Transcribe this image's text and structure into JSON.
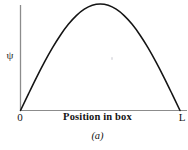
{
  "figure": {
    "caption": "(a)",
    "background_color": "#ffffff",
    "curve_color": "#141414",
    "axis_color": "#8c8c8c"
  },
  "axes": {
    "y_label": "ψ",
    "y_label_name": "psi-symbol",
    "x_title": "Position in box",
    "x_tick_left": "0",
    "x_tick_right": "L"
  },
  "chart_data": {
    "type": "line",
    "title": "",
    "subtitle": "",
    "xlabel": "Position in box",
    "ylabel": "ψ",
    "annotations": [
      "(a)"
    ],
    "legend": [],
    "legend_position": "none",
    "grid": false,
    "xlim": [
      0,
      1
    ],
    "ylim": [
      0,
      1
    ],
    "xtick_labels": [
      "0",
      "L"
    ],
    "xtick_values": [
      0,
      1
    ],
    "ytick_labels": [],
    "ytick_values": [],
    "series": [
      {
        "name": "ψ (n=1)",
        "color": "#141414",
        "x": [
          0.0,
          0.05,
          0.1,
          0.15,
          0.2,
          0.25,
          0.3,
          0.35,
          0.4,
          0.45,
          0.5,
          0.55,
          0.6,
          0.65,
          0.7,
          0.75,
          0.8,
          0.85,
          0.9,
          0.95,
          1.0
        ],
        "values": [
          0.0,
          0.156,
          0.309,
          0.454,
          0.588,
          0.707,
          0.809,
          0.891,
          0.951,
          0.988,
          1.0,
          0.988,
          0.951,
          0.891,
          0.809,
          0.707,
          0.588,
          0.454,
          0.309,
          0.156,
          0.0
        ]
      }
    ]
  }
}
